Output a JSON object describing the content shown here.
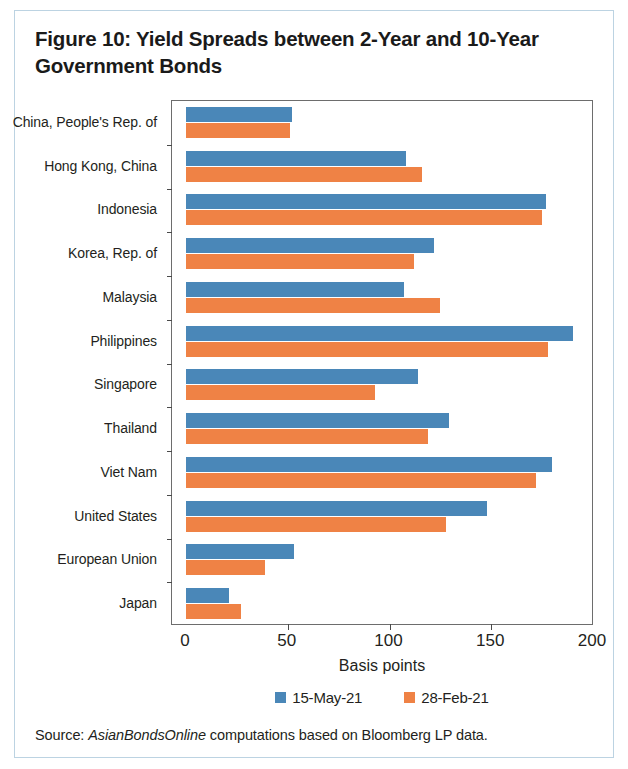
{
  "figure": {
    "title": "Figure 10: Yield Spreads between 2-Year and 10-Year Government Bonds",
    "source_prefix": "Source: ",
    "source_italic": "AsianBondsOnline",
    "source_suffix": " computations based on Bloomberg LP data."
  },
  "colors": {
    "series_1": "#4a87b8",
    "series_2": "#ef8245",
    "axis": "#6d6d6d",
    "frame_border": "#bcd3e2",
    "text": "#231f20"
  },
  "chart_data": {
    "type": "bar",
    "orientation": "horizontal",
    "title": "Figure 10: Yield Spreads between 2-Year and 10-Year Government Bonds",
    "xlabel": "Basis points",
    "ylabel": "",
    "xlim": [
      0,
      200
    ],
    "xticks": [
      0,
      50,
      100,
      150,
      200
    ],
    "xticklabels": [
      "0",
      "50",
      "100",
      "150",
      "200"
    ],
    "grid": false,
    "legend_position": "bottom",
    "categories": [
      "China, People's Rep. of",
      "Hong Kong, China",
      "Indonesia",
      "Korea, Rep. of",
      "Malaysia",
      "Philippines",
      "Singapore",
      "Thailand",
      "Viet Nam",
      "United States",
      "European Union",
      "Japan"
    ],
    "series": [
      {
        "name": "15-May-21",
        "color": "#4a87b8",
        "values": [
          52,
          108,
          177,
          122,
          107,
          190,
          114,
          129,
          180,
          148,
          53,
          21
        ]
      },
      {
        "name": "28-Feb-21",
        "color": "#ef8245",
        "values": [
          51,
          116,
          175,
          112,
          125,
          178,
          93,
          119,
          172,
          128,
          39,
          27
        ]
      }
    ]
  }
}
